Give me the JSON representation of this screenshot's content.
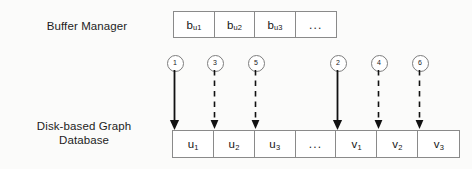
{
  "diagram": {
    "colors": {
      "background": "#fbfbfa",
      "box_border": "#8a8a8a",
      "arrow": "#111111",
      "text": "#1a1a1a"
    },
    "labels": {
      "buffer_manager": "Buffer Manager",
      "disk_database_line1": "Disk-based Graph",
      "disk_database_line2": "Database"
    },
    "buffer_row": {
      "name": "buffer-manager-row",
      "cells": [
        {
          "base": "b",
          "sub": "u1",
          "text": "b_u1",
          "kind": "buffer-page"
        },
        {
          "base": "b",
          "sub": "u2",
          "text": "b_u2",
          "kind": "buffer-page"
        },
        {
          "base": "b",
          "sub": "u3",
          "text": "b_u3",
          "kind": "buffer-page"
        },
        {
          "base": "...",
          "sub": "",
          "text": "...",
          "kind": "ellipsis"
        }
      ]
    },
    "disk_row": {
      "name": "disk-graph-database-row",
      "cells": [
        {
          "base": "u",
          "sub": "1",
          "text": "u_1",
          "kind": "disk-page"
        },
        {
          "base": "u",
          "sub": "2",
          "text": "u_2",
          "kind": "disk-page"
        },
        {
          "base": "u",
          "sub": "3",
          "text": "u_3",
          "kind": "disk-page"
        },
        {
          "base": "...",
          "sub": "",
          "text": "...",
          "kind": "ellipsis"
        },
        {
          "base": "v",
          "sub": "1",
          "text": "v_1",
          "kind": "disk-page"
        },
        {
          "base": "v",
          "sub": "2",
          "text": "v_2",
          "kind": "disk-page"
        },
        {
          "base": "v",
          "sub": "3",
          "text": "v_3",
          "kind": "disk-page"
        }
      ]
    },
    "steps": [
      {
        "number": "1",
        "x": 174,
        "style": "solid",
        "target": "u_1"
      },
      {
        "number": "3",
        "x": 214,
        "style": "dashed",
        "target": "u_2"
      },
      {
        "number": "5",
        "x": 255,
        "style": "dashed",
        "target": "u_3"
      },
      {
        "number": "2",
        "x": 337,
        "style": "solid",
        "target": "v_1"
      },
      {
        "number": "4",
        "x": 378,
        "style": "dashed",
        "target": "v_2"
      },
      {
        "number": "6",
        "x": 419,
        "style": "dashed",
        "target": "v_3"
      }
    ]
  }
}
